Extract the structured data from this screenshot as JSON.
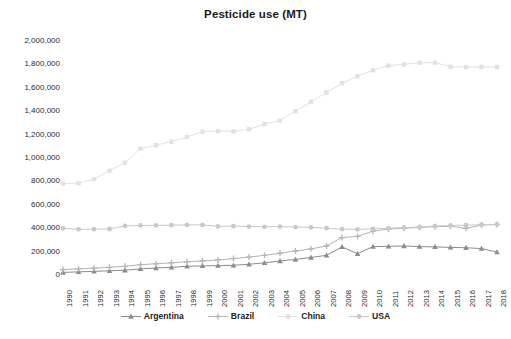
{
  "chart_data": {
    "type": "line",
    "title": "Pesticide use (MT)",
    "xlabel": "",
    "ylabel": "",
    "ylim": [
      0,
      2000000
    ],
    "ytick_step": 200000,
    "grid": false,
    "legend_position": "bottom",
    "x": [
      1990,
      1991,
      1992,
      1993,
      1994,
      1995,
      1996,
      1997,
      1998,
      1999,
      2000,
      2001,
      2002,
      2003,
      2004,
      2005,
      2006,
      2007,
      2008,
      2009,
      2010,
      2011,
      2012,
      2013,
      2014,
      2015,
      2016,
      2017,
      2018
    ],
    "ytick_labels": [
      "2,000,000",
      "1,800,000",
      "1,600,000",
      "1,400,000",
      "1,200,000",
      "1,000,000",
      "800,000",
      "600,000",
      "400,000",
      "200,000",
      "0"
    ],
    "ytick_values": [
      2000000,
      1800000,
      1600000,
      1400000,
      1200000,
      1000000,
      800000,
      600000,
      400000,
      200000,
      0
    ],
    "xtick_labels": [
      "1990",
      "1991",
      "1992",
      "1993",
      "1994",
      "1995",
      "1996",
      "1997",
      "1998",
      "1999",
      "2000",
      "2001",
      "2002",
      "2003",
      "2004",
      "2005",
      "2006",
      "2007",
      "2008",
      "2009",
      "2010",
      "2011",
      "2012",
      "2013",
      "2014",
      "2015",
      "2016",
      "2017",
      "2018"
    ],
    "series": [
      {
        "name": "Argentina",
        "color": "#8c8c8c",
        "marker": "triangle",
        "values": [
          22000,
          27000,
          31000,
          36000,
          41000,
          52000,
          60000,
          66000,
          74000,
          78000,
          80000,
          83000,
          92000,
          104000,
          120000,
          133000,
          150000,
          168000,
          240000,
          182000,
          243000,
          245000,
          248000,
          243000,
          240000,
          236000,
          233000,
          226000,
          196000
        ]
      },
      {
        "name": "Brazil",
        "color": "#b5b5b5",
        "marker": "plus",
        "values": [
          46000,
          52000,
          58000,
          66000,
          74000,
          88000,
          96000,
          104000,
          113000,
          120000,
          129000,
          140000,
          153000,
          168000,
          186000,
          205000,
          223000,
          248000,
          320000,
          330000,
          375000,
          392000,
          400000,
          406000,
          413000,
          418000,
          399000,
          427000,
          432000
        ]
      },
      {
        "name": "China",
        "color": "#e2e2e2",
        "marker": "square",
        "values": [
          780000,
          785000,
          820000,
          890000,
          960000,
          1080000,
          1110000,
          1140000,
          1180000,
          1225000,
          1230000,
          1228000,
          1245000,
          1290000,
          1320000,
          1400000,
          1480000,
          1560000,
          1640000,
          1700000,
          1750000,
          1790000,
          1800000,
          1815000,
          1815000,
          1780000,
          1778000,
          1778000,
          1778000
        ]
      },
      {
        "name": "USA",
        "color": "#c9c9c9",
        "marker": "circle",
        "values": [
          400000,
          390000,
          392000,
          393000,
          420000,
          424000,
          424000,
          426000,
          428000,
          428000,
          416000,
          418000,
          414000,
          412000,
          414000,
          410000,
          407000,
          400000,
          392000,
          390000,
          395000,
          400000,
          405000,
          410000,
          418000,
          424000,
          426000,
          430000,
          432000
        ]
      }
    ]
  }
}
